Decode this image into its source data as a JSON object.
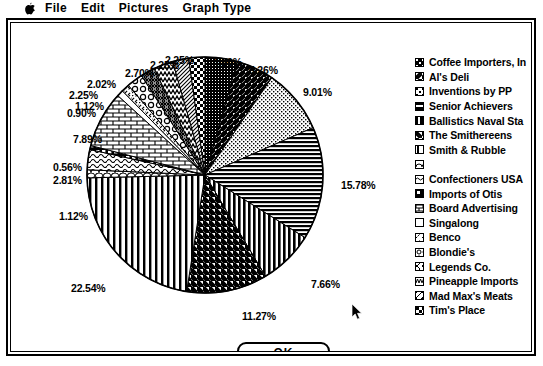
{
  "menubar": {
    "apple_icon": "apple-icon",
    "items": [
      {
        "label": "File"
      },
      {
        "label": "Edit"
      },
      {
        "label": "Pictures"
      },
      {
        "label": "Graph Type"
      }
    ]
  },
  "dialog": {
    "ok_label": "OK"
  },
  "cursor": {
    "name": "arrow-cursor"
  },
  "chart_data": {
    "type": "pie",
    "title": "",
    "legend_position": "right",
    "value_unit": "percent",
    "categories": [
      "Coffee Importers, In",
      "Al's Deli",
      "Inventions by PP",
      "Senior Achievers",
      "Ballistics Naval Sta",
      "The Smithereens",
      "Smith & Rubble",
      "",
      "Confectioners USA",
      "Imports of Otis",
      "Board Advertising",
      "Singalong",
      "Benco",
      "Blondie's",
      "Legends Co.",
      "Pineapple Imports",
      "Mad Max's Meats",
      "Tim's Place"
    ],
    "values": [
      4.5,
      5.26,
      9.01,
      15.78,
      7.66,
      11.27,
      22.54,
      1.12,
      2.81,
      0.56,
      7.89,
      0.9,
      1.12,
      2.25,
      2.02,
      2.7,
      2.25,
      2.25
    ],
    "labels": [
      "4.50%",
      "5.26%",
      "9.01%",
      "15.78%",
      "7.66%",
      "11.27%",
      "22.54%",
      "1.12%",
      "2.81%",
      "0.56%",
      "7.89%",
      "0.90%",
      "1.12%",
      "2.25%",
      "2.02%",
      "2.70%",
      "2.25%",
      "2.25%"
    ],
    "slices": [
      {
        "label": "4.50%",
        "name": "Coffee Importers, In",
        "value": 4.5,
        "pattern": "dense-dither"
      },
      {
        "label": "5.26%",
        "name": "Al's Deli",
        "value": 5.26,
        "pattern": "diagonal-up"
      },
      {
        "label": "9.01%",
        "name": "Inventions by PP",
        "value": 9.01,
        "pattern": "fine-dots"
      },
      {
        "label": "15.78%",
        "name": "Senior Achievers",
        "value": 15.78,
        "pattern": "horizontal-lines"
      },
      {
        "label": "7.66%",
        "name": "Ballistics Naval Sta",
        "value": 7.66,
        "pattern": "vertical-thin"
      },
      {
        "label": "11.27%",
        "name": "The Smithereens",
        "value": 11.27,
        "pattern": "diagonal-down"
      },
      {
        "label": "22.54%",
        "name": "Smith & Rubble",
        "value": 22.54,
        "pattern": "vertical-lines"
      },
      {
        "label": "1.12%",
        "name": "",
        "value": 1.12,
        "pattern": "scales"
      },
      {
        "label": "2.81%",
        "name": "Confectioners USA",
        "value": 2.81,
        "pattern": "waves"
      },
      {
        "label": "0.56%",
        "name": "Imports of Otis",
        "value": 0.56,
        "pattern": "grid"
      },
      {
        "label": "7.89%",
        "name": "Board Advertising",
        "value": 7.89,
        "pattern": "brick"
      },
      {
        "label": "0.90%",
        "name": "Singalong",
        "value": 0.9,
        "pattern": "plain"
      },
      {
        "label": "1.12%",
        "name": "Benco",
        "value": 1.12,
        "pattern": "dashes"
      },
      {
        "label": "2.25%",
        "name": "Blondie's",
        "value": 2.25,
        "pattern": "circles"
      },
      {
        "label": "2.02%",
        "name": "Legends Co.",
        "value": 2.02,
        "pattern": "crosshatch"
      },
      {
        "label": "2.70%",
        "name": "Pineapple Imports",
        "value": 2.7,
        "pattern": "zigzag"
      },
      {
        "label": "2.25%",
        "name": "Mad Max's Meats",
        "value": 2.25,
        "pattern": "diagonal-fine"
      },
      {
        "label": "2.25%",
        "name": "Tim's Place",
        "value": 2.25,
        "pattern": "checker"
      }
    ]
  },
  "legend": {
    "items": [
      {
        "label": "Coffee Importers, In",
        "swatch": "swatch-dense-dither"
      },
      {
        "label": "Al's Deli",
        "swatch": "swatch-diagonal-up"
      },
      {
        "label": "Inventions by PP",
        "swatch": "swatch-fine-dots"
      },
      {
        "label": "Senior Achievers",
        "swatch": "swatch-horizontal-lines"
      },
      {
        "label": "Ballistics Naval Sta",
        "swatch": "swatch-vertical-thin"
      },
      {
        "label": "The Smithereens",
        "swatch": "swatch-diagonal-down"
      },
      {
        "label": "Smith & Rubble",
        "swatch": "swatch-vertical-lines"
      },
      {
        "label": "",
        "swatch": "swatch-scales"
      },
      {
        "label": "Confectioners USA",
        "swatch": "swatch-waves"
      },
      {
        "label": "Imports of Otis",
        "swatch": "swatch-grid"
      },
      {
        "label": "Board Advertising",
        "swatch": "swatch-brick"
      },
      {
        "label": "Singalong",
        "swatch": "swatch-plain"
      },
      {
        "label": "Benco",
        "swatch": "swatch-dashes"
      },
      {
        "label": "Blondie's",
        "swatch": "swatch-circles"
      },
      {
        "label": "Legends Co.",
        "swatch": "swatch-crosshatch"
      },
      {
        "label": "Pineapple Imports",
        "swatch": "swatch-zigzag"
      },
      {
        "label": "Mad Max's Meats",
        "swatch": "swatch-diagonal-fine"
      },
      {
        "label": "Tim's Place",
        "swatch": "swatch-checker"
      }
    ]
  }
}
